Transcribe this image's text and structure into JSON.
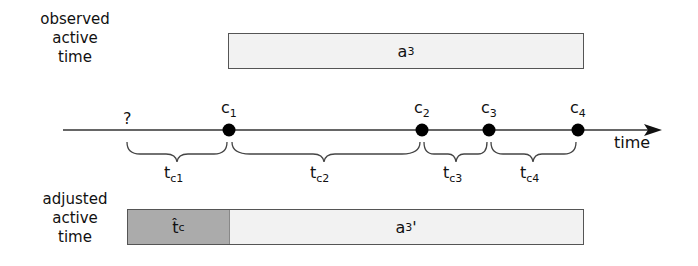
{
  "observed": {
    "label_lines": [
      "observed",
      "active",
      "time"
    ],
    "bar_label": "a",
    "bar_label_sub": "3"
  },
  "adjusted": {
    "label_lines": [
      "adjusted",
      "active",
      "time"
    ],
    "estimate_label": "t̂",
    "estimate_sub": "c",
    "bar_label": "a",
    "bar_label_sub": "3",
    "bar_label_prime": "'"
  },
  "timeline": {
    "axis_label": "time",
    "unknown_marker": "?",
    "events": [
      {
        "name": "c",
        "sub": "1",
        "x": 229
      },
      {
        "name": "c",
        "sub": "2",
        "x": 422
      },
      {
        "name": "c",
        "sub": "3",
        "x": 489
      },
      {
        "name": "c",
        "sub": "4",
        "x": 578
      }
    ],
    "intervals": [
      {
        "name": "t",
        "sub": "c1"
      },
      {
        "name": "t",
        "sub": "c2"
      },
      {
        "name": "t",
        "sub": "c3"
      },
      {
        "name": "t",
        "sub": "c4"
      }
    ]
  },
  "colors": {
    "bar_fill": "#f2f2f2",
    "estimate_fill": "#ababab",
    "line": "#333333",
    "dot": "#000000"
  }
}
